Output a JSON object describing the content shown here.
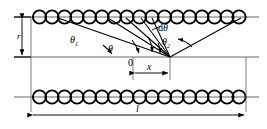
{
  "figure": {
    "kind": "optics-scattering-geometry-diagram",
    "colors": {
      "stroke": "#000000",
      "axis": "#555555",
      "background": "#ffffff"
    },
    "labels": {
      "gap_radius": "r",
      "angle_incident": "θ",
      "angle_incident_sub": "1",
      "angle_theta": "θ",
      "angle_differential": "dθ",
      "angle_exit": "θ",
      "angle_exit_sub": "2",
      "origin": "0",
      "offset": "x",
      "length": "l"
    },
    "geometry": {
      "top_chain": {
        "center_y": 17,
        "circle_count": 17,
        "circle_radius": 6.6,
        "x_start": 33,
        "x_end": 243
      },
      "bottom_chain": {
        "center_y": 97,
        "circle_count": 18,
        "circle_radius": 6.6,
        "x_start": 33,
        "x_end": 245
      },
      "axis_line_y": 57,
      "vertex": {
        "x": 170,
        "y": 57
      },
      "origin_tick_x": 133,
      "dim_r": {
        "x": 22,
        "y_top": 17,
        "y_bottom": 57
      },
      "dim_x": {
        "y": 73,
        "x_left": 133,
        "x_right": 170
      },
      "dim_l": {
        "y": 115,
        "x_left": 31,
        "x_right": 246
      },
      "rays_to_top_chain_x": [
        60,
        108,
        126,
        141,
        152,
        240
      ],
      "arc_markers": [
        "theta1",
        "theta",
        "dtheta",
        "theta2"
      ]
    }
  }
}
